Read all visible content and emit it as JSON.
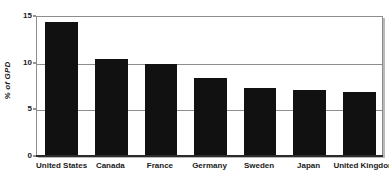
{
  "chart_data": {
    "type": "bar",
    "title": "",
    "subtitle": "",
    "xlabel": "",
    "ylabel": "% of GPD",
    "categories": [
      "United States",
      "Canada",
      "France",
      "Germany",
      "Sweden",
      "Japan",
      "United Kingdom"
    ],
    "values": [
      14.2,
      10.25,
      9.8,
      8.2,
      7.2,
      7.0,
      6.7
    ],
    "series": [
      {
        "name": "Health expenditure",
        "values": [
          14.2,
          10.25,
          9.8,
          8.2,
          7.2,
          7.0,
          6.7
        ]
      }
    ],
    "ylim": [
      0,
      15
    ],
    "yticks": [
      0,
      5,
      10,
      15
    ],
    "ytick_labels": [
      "0",
      "5",
      "10",
      "15"
    ],
    "grid": true,
    "gridlines_at": [
      5,
      10,
      15
    ],
    "legend": false,
    "legend_position": "none",
    "annotations": [],
    "colors": {
      "bar": "#111111",
      "grid": "#8d8d8d",
      "axis": "#2b2b2b",
      "text": "#1a1a1a",
      "background": "#ffffff",
      "frame_shadow": "#b9b9b9"
    }
  }
}
